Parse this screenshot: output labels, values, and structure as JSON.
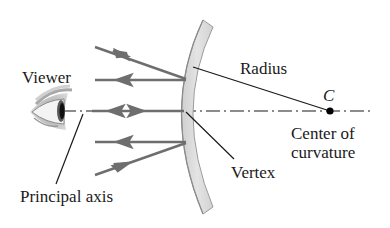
{
  "diagram": {
    "labels": {
      "viewer": "Viewer",
      "radius": "Radius",
      "center_symbol": "C",
      "center_line1": "Center of",
      "center_line2": "curvature",
      "vertex": "Vertex",
      "principal_axis": "Principal axis"
    },
    "colors": {
      "ray": "#6e6e6e",
      "line": "#1a1a1a",
      "mirror_fill": "#dcdcdc",
      "mirror_edge": "#9a9a9a"
    },
    "elements": {
      "mirror": "curved mirror (arc)",
      "eye": "viewer eye",
      "rays": [
        {
          "name": "incident-ray-top",
          "direction": "toward mirror"
        },
        {
          "name": "reflected-ray-top",
          "direction": "toward viewer"
        },
        {
          "name": "axis-ray",
          "direction": "both"
        },
        {
          "name": "reflected-ray-bottom",
          "direction": "toward viewer"
        },
        {
          "name": "incident-ray-bottom",
          "direction": "toward mirror"
        }
      ]
    }
  }
}
